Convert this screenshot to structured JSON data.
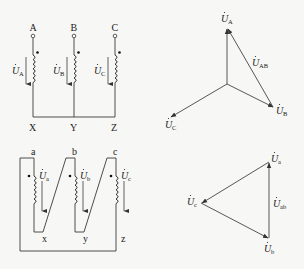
{
  "wye_circuit": {
    "terminals_top": [
      "A",
      "B",
      "C"
    ],
    "terminals_bottom": [
      "X",
      "Y",
      "Z"
    ],
    "voltage_labels": [
      {
        "symbol": "U",
        "sub": "A"
      },
      {
        "symbol": "U",
        "sub": "B"
      },
      {
        "symbol": "U",
        "sub": "C"
      }
    ]
  },
  "wye_phasor": {
    "labels": {
      "ua": {
        "symbol": "U",
        "sub": "A"
      },
      "ub": {
        "symbol": "U",
        "sub": "B"
      },
      "uc": {
        "symbol": "U",
        "sub": "C"
      },
      "uab": {
        "symbol": "U",
        "sub": "AB"
      }
    }
  },
  "delta_circuit": {
    "terminals_top": [
      "a",
      "b",
      "c"
    ],
    "terminals_bottom": [
      "x",
      "y",
      "z"
    ],
    "voltage_labels": [
      {
        "symbol": "U",
        "sub": "a"
      },
      {
        "symbol": "U",
        "sub": "b"
      },
      {
        "symbol": "U",
        "sub": "c"
      }
    ]
  },
  "delta_phasor": {
    "labels": {
      "ua": {
        "symbol": "U",
        "sub": "a"
      },
      "ub": {
        "symbol": "U",
        "sub": "b"
      },
      "uc": {
        "symbol": "U",
        "sub": "c"
      },
      "uab": {
        "symbol": "U",
        "sub": "ab"
      }
    }
  }
}
